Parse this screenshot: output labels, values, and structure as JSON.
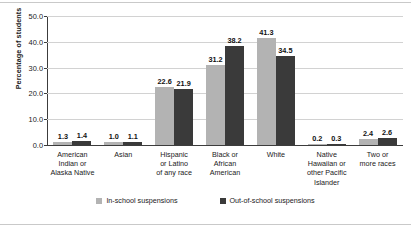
{
  "chart_data": {
    "type": "bar",
    "title": "",
    "xlabel": "",
    "ylabel": "Percentage of students",
    "ylim": [
      0,
      50
    ],
    "yticks": [
      "0.0",
      "10.0",
      "20.0",
      "30.0",
      "40.0",
      "50.0"
    ],
    "grid": true,
    "legend_position": "bottom",
    "categories": [
      "American Indian or Alaska Native",
      "Asian",
      "Hispanic or Latino of any race",
      "Black or African American",
      "White",
      "Native Hawaiian or other Pacific Islander",
      "Two or more races"
    ],
    "category_lines": [
      [
        "American",
        "Indian or",
        "Alaska Native"
      ],
      [
        "Asian"
      ],
      [
        "Hispanic",
        "or Latino",
        "of any race"
      ],
      [
        "Black or",
        "African",
        "American"
      ],
      [
        "White"
      ],
      [
        "Native",
        "Hawaiian or",
        "other Pacific",
        "Islander"
      ],
      [
        "Two or",
        "more races"
      ]
    ],
    "series": [
      {
        "name": "In-school suspensions",
        "color": "#b3b3b3",
        "values": [
          1.3,
          1.0,
          22.6,
          31.2,
          41.3,
          0.2,
          2.4
        ],
        "labels": [
          "1.3",
          "1.0",
          "22.6",
          "31.2",
          "41.3",
          "0.2",
          "2.4"
        ]
      },
      {
        "name": "Out-of-school suspensions",
        "color": "#3a3a3a",
        "values": [
          1.4,
          1.1,
          21.9,
          38.2,
          34.5,
          0.3,
          2.6
        ],
        "labels": [
          "1.4",
          "1.1",
          "21.9",
          "38.2",
          "34.5",
          "0.3",
          "2.6"
        ]
      }
    ]
  },
  "legend": [
    {
      "label": "In-school suspensions",
      "color": "#b3b3b3"
    },
    {
      "label": "Out-of-school suspensions",
      "color": "#3a3a3a"
    }
  ]
}
